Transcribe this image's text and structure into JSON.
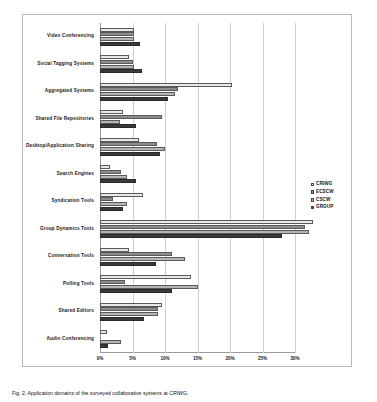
{
  "chart_data": {
    "type": "bar",
    "orientation": "horizontal",
    "title": "",
    "xlabel": "",
    "ylabel": "",
    "xlim": [
      0,
      30
    ],
    "xticks": [
      0,
      5,
      10,
      15,
      20,
      25,
      30
    ],
    "xtick_labels": [
      "0%",
      "5%",
      "10%",
      "15%",
      "20%",
      "25%",
      "30%"
    ],
    "grid": true,
    "legend_position": "right",
    "categories": [
      "Video Conferencing",
      "Social Tagging Systems",
      "Aggregated Systems",
      "Shared File Repositories",
      "Desktop/Application Sharing",
      "Search Engines",
      "Syndication Tools",
      "Group Dynamics Tools",
      "Conversation Tools",
      "Polling Tools",
      "Shared Editors",
      "Audio Conferencing"
    ],
    "series": [
      {
        "name": "CRIWG",
        "color": "#e8e8e8",
        "values": [
          5.3,
          4.4,
          20.3,
          3.5,
          6.0,
          1.5,
          6.6,
          32.7,
          4.5,
          14.0,
          9.6,
          1.0
        ]
      },
      {
        "name": "ECSCW",
        "color": "#8c8c8c",
        "values": [
          5.3,
          5.0,
          12.0,
          9.5,
          8.8,
          3.2,
          2.0,
          31.5,
          11.0,
          3.8,
          8.9,
          0.0
        ]
      },
      {
        "name": "CSCW",
        "color": "#b5b5b5",
        "values": [
          5.3,
          5.3,
          11.6,
          3.0,
          10.0,
          4.2,
          4.2,
          32.2,
          13.0,
          15.0,
          8.9,
          3.3
        ]
      },
      {
        "name": "GROUP",
        "color": "#3a3a3a",
        "values": [
          6.2,
          6.4,
          10.5,
          5.5,
          9.2,
          5.6,
          3.6,
          28.0,
          8.6,
          11.0,
          6.8,
          1.2
        ]
      }
    ]
  },
  "legend": {
    "items": [
      {
        "label": "CRIWG"
      },
      {
        "label": "ECSCW"
      },
      {
        "label": "CSCW"
      },
      {
        "label": "GROUP"
      }
    ]
  },
  "caption": {
    "text": "Fig. 2. Application domains of the surveyed collaborative systems at CRIWG,"
  }
}
